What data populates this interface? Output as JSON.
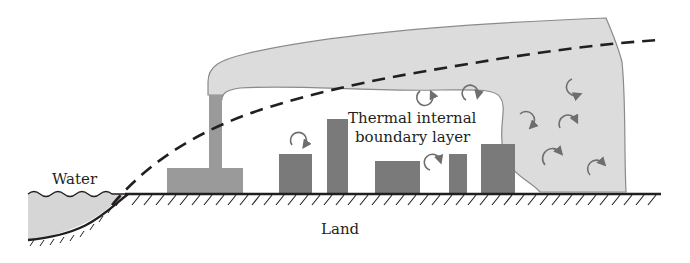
{
  "diagram": {
    "labels": {
      "water": "Water",
      "land": "Land",
      "tibl_line1": "Thermal internal",
      "tibl_line2": "boundary layer"
    },
    "elements": [
      "water-body",
      "land-surface",
      "power-plant-chimney",
      "smoke-plume",
      "thermal-internal-boundary-layer-line",
      "buildings",
      "turbulent-eddy-arrows"
    ],
    "colors": {
      "plume_fill": "#dcdcdc",
      "plume_stroke": "#8a8a8a",
      "building_fill": "#7a7a7a",
      "plant_fill": "#9a9a9a",
      "water_fill": "#d6d6d6",
      "line": "#231f20",
      "eddy_arrow": "#6e6e6e"
    }
  }
}
